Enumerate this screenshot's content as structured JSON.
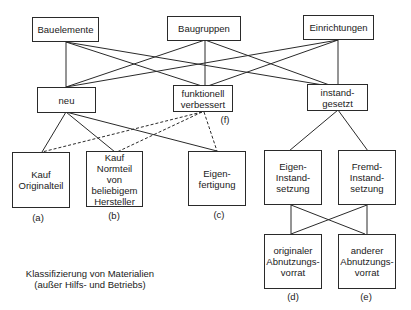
{
  "top_nodes": {
    "bauelemente": "Bauelemente",
    "baugruppen": "Baugruppen",
    "einrichtungen": "Einrichtungen"
  },
  "middle_nodes": {
    "neu": "neu",
    "funktionell": "funktionell\nverbessert",
    "instandgesetzt": "instand-\ngesetzt"
  },
  "bottom_left_nodes": {
    "kauf_original": "Kauf\nOriginalteil",
    "kauf_normteil": "Kauf\nNormteil\nvon\nbeliebigem\nHersteller",
    "eigenfertigung": "Eigen-\nfertigung"
  },
  "repair_nodes": {
    "eigen_instand": "Eigen-\nInstand-\nsetzung",
    "fremd_instand": "Fremd-\nInstand-\nsetzung"
  },
  "stock_nodes": {
    "originaler": "originaler\nAbnutzungs-\nvorrat",
    "anderer": "anderer\nAbnutzungs-\nvorrat"
  },
  "labels": {
    "a": "(a)",
    "b": "(b)",
    "c": "(c)",
    "d": "(d)",
    "e": "(e)",
    "f": "(f)"
  },
  "caption": "Klassifizierung von Materialien\n(außer Hilfs- und Betriebs)"
}
